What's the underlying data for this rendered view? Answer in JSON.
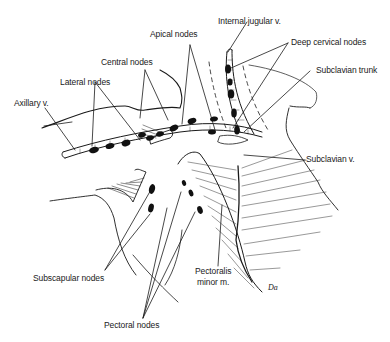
{
  "figure": {
    "type": "anatomical-line-drawing",
    "ink_color": "#1a1a1a",
    "background": "#ffffff"
  },
  "labels": {
    "apical_nodes": "Apical nodes",
    "internal_jugular_v": "Internal jugular v.",
    "deep_cervical_nodes": "Deep cervical nodes",
    "central_nodes": "Central nodes",
    "subclavian_trunk": "Subclavian trunk",
    "lateral_nodes": "Lateral nodes",
    "axillary_v": "Axillary v.",
    "subclavian_v": "Subclavian v.",
    "subscapular_nodes": "Subscapular nodes",
    "pectoralis_minor_line1": "Pectoralis",
    "pectoralis_minor_line2": "minor m.",
    "pectoral_nodes": "Pectoral nodes",
    "signature": "Da"
  }
}
